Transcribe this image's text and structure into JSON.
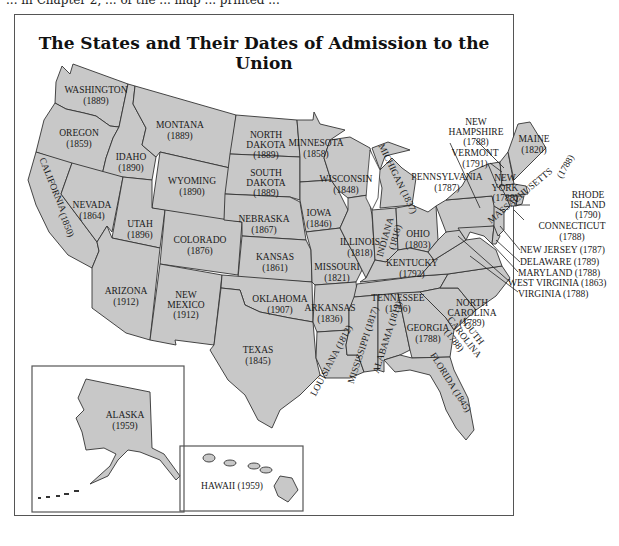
{
  "page": {
    "top_fragment_text": "... in Chapter 2, ... of the ... map ... printed ..."
  },
  "map": {
    "title": "The States and Their Dates of Admission to the Union",
    "fill_color": "#c8c8c8",
    "border_color": "#333333",
    "states": {
      "washington": {
        "name": "WASHINGTON",
        "year": "(1889)"
      },
      "oregon": {
        "name": "OREGON",
        "year": "(1859)"
      },
      "california": {
        "name": "CALIFORNIA",
        "year": "(1850)"
      },
      "idaho": {
        "name": "IDAHO",
        "year": "(1890)"
      },
      "nevada": {
        "name": "NEVADA",
        "year": "(1864)"
      },
      "montana": {
        "name": "MONTANA",
        "year": "(1889)"
      },
      "wyoming": {
        "name": "WYOMING",
        "year": "(1890)"
      },
      "utah": {
        "name": "UTAH",
        "year": "(1896)"
      },
      "arizona": {
        "name": "ARIZONA",
        "year": "(1912)"
      },
      "colorado": {
        "name": "COLORADO",
        "year": "(1876)"
      },
      "new_mexico": {
        "name_1": "NEW",
        "name_2": "MEXICO",
        "year": "(1912)"
      },
      "north_dakota": {
        "name_1": "NORTH",
        "name_2": "DAKOTA",
        "year": "(1889)"
      },
      "south_dakota": {
        "name_1": "SOUTH",
        "name_2": "DAKOTA",
        "year": "(1889)"
      },
      "nebraska": {
        "name": "NEBRASKA",
        "year": "(1867)"
      },
      "kansas": {
        "name": "KANSAS",
        "year": "(1861)"
      },
      "oklahoma": {
        "name": "OKLAHOMA",
        "year": "(1907)"
      },
      "texas": {
        "name": "TEXAS",
        "year": "(1845)"
      },
      "minnesota": {
        "name": "MINNESOTA",
        "year": "(1858)"
      },
      "iowa": {
        "name": "IOWA",
        "year": "(1846)"
      },
      "missouri": {
        "name": "MISSOURI",
        "year": "(1821)"
      },
      "arkansas": {
        "name": "ARKANSAS",
        "year": "(1836)"
      },
      "louisiana": {
        "label": "LOUISIANA (1812)"
      },
      "wisconsin": {
        "name": "WISCONSIN",
        "year": "(1848)"
      },
      "illinois": {
        "name": "ILLINOIS",
        "year": "(1818)"
      },
      "michigan": {
        "label": "MICHIGAN (1837)"
      },
      "indiana": {
        "name": "INDIANA",
        "year": "(1816)"
      },
      "ohio": {
        "name": "OHIO",
        "year": "(1803)"
      },
      "kentucky": {
        "name": "KENTUCKY",
        "year": "(1792)"
      },
      "tennessee": {
        "name": "TENNESSEE",
        "year": "(1796)"
      },
      "mississippi": {
        "label": "MISSISSIPPI (1817)"
      },
      "alabama": {
        "label": "ALABAMA (1819)"
      },
      "georgia": {
        "name": "GEORGIA",
        "year": "(1788)"
      },
      "florida": {
        "label": "FLORIDA (1845)"
      },
      "south_carolina": {
        "name_1": "SOUTH",
        "name_2": "CAROLINA",
        "year": "(1788)"
      },
      "north_carolina": {
        "name_1": "NORTH",
        "name_2": "CAROLINA",
        "year": "(1789)"
      },
      "pennsylvania": {
        "name": "PENNSYLVANIA",
        "year": "(1787)"
      },
      "new_york": {
        "name_1": "NEW",
        "name_2": "YORK",
        "year": "(1788)"
      },
      "vermont": {
        "name": "VERMONT",
        "year": "(1791)"
      },
      "new_hampshire": {
        "name_1": "NEW",
        "name_2": "HAMPSHIRE",
        "year": "(1788)"
      },
      "maine": {
        "name": "MAINE",
        "year": "(1820)"
      },
      "massachusetts": {
        "name": "MASSACHUSETTS",
        "year": "(1788)"
      },
      "rhode_island": {
        "name_1": "RHODE",
        "name_2": "ISLAND",
        "year": "(1790)"
      },
      "connecticut": {
        "name": "CONNECTICUT",
        "year": "(1788)"
      },
      "new_jersey": {
        "label": "NEW JERSEY (1787)"
      },
      "delaware": {
        "label": "DELAWARE (1789)"
      },
      "maryland": {
        "label": "MARYLAND (1788)"
      },
      "west_virginia": {
        "label": "WEST VIRGINIA (1863)"
      },
      "virginia": {
        "label": "VIRGINIA (1788)"
      }
    },
    "insets": {
      "alaska": {
        "name": "ALASKA",
        "year": "(1959)"
      },
      "hawaii": {
        "label": "HAWAII (1959)"
      }
    }
  }
}
